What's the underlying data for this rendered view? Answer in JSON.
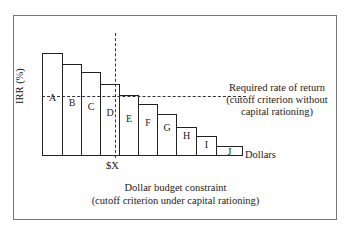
{
  "chart_data": {
    "type": "bar",
    "title": "",
    "xlabel": "Dollars",
    "ylabel": "IRR (%)",
    "categories": [
      "A",
      "B",
      "C",
      "D",
      "E",
      "F",
      "G",
      "H",
      "I",
      "J"
    ],
    "values": [
      103,
      92,
      84,
      72,
      61,
      52,
      42,
      29,
      20,
      10
    ],
    "value_note": "Relative heights in pixels above the baseline; no numeric scale shown",
    "annotations": {
      "budget_line_label": "$X",
      "budget_caption_line1": "Dollar budget constraint",
      "budget_caption_line2": "(cutoff criterion under capital rationing)",
      "rate_caption_line1": "Required rate of return",
      "rate_caption_line2": "(cutoff criterion without",
      "rate_caption_line3": "capital rationing)"
    }
  },
  "bars": [
    {
      "label": "A",
      "x": 42,
      "w": 20,
      "top": 53
    },
    {
      "label": "B",
      "x": 62,
      "w": 19,
      "top": 64
    },
    {
      "label": "C",
      "x": 81,
      "w": 19,
      "top": 72
    },
    {
      "label": "D",
      "x": 100,
      "w": 19,
      "top": 84
    },
    {
      "label": "E",
      "x": 119,
      "w": 19,
      "top": 95
    },
    {
      "label": "F",
      "x": 138,
      "w": 19,
      "top": 104
    },
    {
      "label": "G",
      "x": 157,
      "w": 19,
      "top": 114
    },
    {
      "label": "H",
      "x": 176,
      "w": 20,
      "top": 127
    },
    {
      "label": "I",
      "x": 196,
      "w": 20,
      "top": 136
    },
    {
      "label": "J",
      "x": 216,
      "w": 26,
      "top": 146
    }
  ]
}
